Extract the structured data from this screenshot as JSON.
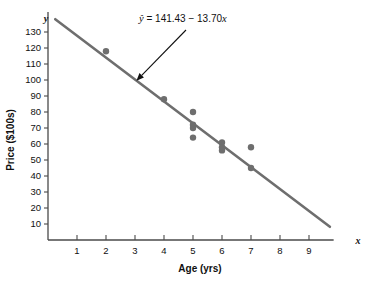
{
  "chart_data": {
    "type": "scatter",
    "title": "",
    "xlabel": "Age (yrs)",
    "ylabel": "Price ($100s)",
    "x_axis_symbol": "x",
    "y_axis_symbol": "y",
    "xlim": [
      0,
      10
    ],
    "ylim": [
      0,
      140
    ],
    "xticks": [
      1,
      2,
      3,
      4,
      5,
      6,
      7,
      8,
      9
    ],
    "xtick_labels": [
      "1",
      "2",
      "3",
      "4",
      "5",
      "6",
      "7",
      "8",
      "9"
    ],
    "yticks": [
      10,
      20,
      30,
      40,
      50,
      60,
      70,
      80,
      90,
      100,
      110,
      120,
      130
    ],
    "ytick_labels": [
      "10",
      "20",
      "30",
      "40",
      "50",
      "60",
      "70",
      "80",
      "90",
      "100",
      "110",
      "120",
      "130"
    ],
    "grid": false,
    "legend": null,
    "points": [
      {
        "x": 2,
        "y": 118
      },
      {
        "x": 4,
        "y": 88
      },
      {
        "x": 5,
        "y": 80
      },
      {
        "x": 5,
        "y": 72
      },
      {
        "x": 5,
        "y": 70
      },
      {
        "x": 5,
        "y": 64
      },
      {
        "x": 6,
        "y": 61
      },
      {
        "x": 6,
        "y": 58
      },
      {
        "x": 6,
        "y": 56
      },
      {
        "x": 7,
        "y": 58
      },
      {
        "x": 7,
        "y": 45
      }
    ],
    "fit_line": {
      "intercept": 141.43,
      "slope": -13.7,
      "x_start": 0.25,
      "x_end": 9.72
    },
    "annotation": {
      "text": "ŷ = 141.43 − 13.70x",
      "equation_lhs": "ŷ",
      "equation_rhs": "= 141.43 − 13.70",
      "equation_var": "x",
      "target_x": 3.05,
      "target_y": 99.6
    },
    "colors": {
      "line": "#6e6e6e",
      "point": "#6e6e6e",
      "axis": "#4a4a4a",
      "text": "#101010",
      "background": "#ffffff"
    }
  }
}
